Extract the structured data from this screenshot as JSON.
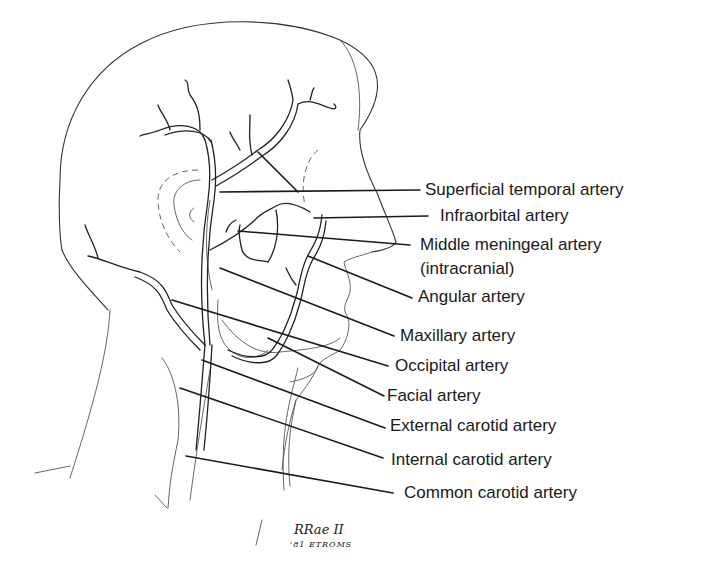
{
  "figure": {
    "labels": [
      {
        "id": "superficial-temporal",
        "text": "Superficial temporal artery",
        "x": 425,
        "y": 180
      },
      {
        "id": "infraorbital",
        "text": "Infraorbital artery",
        "x": 440,
        "y": 206
      },
      {
        "id": "middle-meningeal",
        "text": "Middle meningeal artery",
        "x": 420,
        "y": 235
      },
      {
        "id": "middle-meningeal-note",
        "text": "(intracranial)",
        "x": 420,
        "y": 259
      },
      {
        "id": "angular",
        "text": "Angular artery",
        "x": 418,
        "y": 287
      },
      {
        "id": "maxillary",
        "text": "Maxillary artery",
        "x": 400,
        "y": 326
      },
      {
        "id": "occipital",
        "text": "Occipital artery",
        "x": 395,
        "y": 356
      },
      {
        "id": "facial",
        "text": "Facial artery",
        "x": 387,
        "y": 386
      },
      {
        "id": "external-carotid",
        "text": "External carotid artery",
        "x": 390,
        "y": 416
      },
      {
        "id": "internal-carotid",
        "text": "Internal carotid artery",
        "x": 391,
        "y": 450
      },
      {
        "id": "common-carotid",
        "text": "Common carotid artery",
        "x": 404,
        "y": 483
      }
    ],
    "signature": {
      "name": "RRae II",
      "date": "'81 ETROMS"
    }
  }
}
